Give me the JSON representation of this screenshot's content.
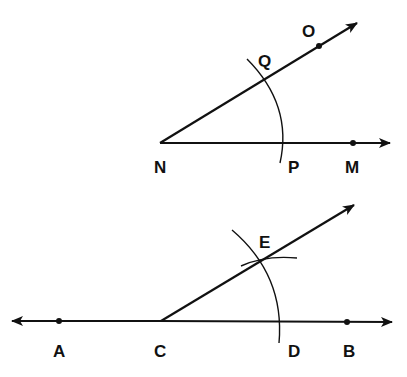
{
  "figure": {
    "top_construction": {
      "vertex": "N",
      "labels": {
        "N": "N",
        "P": "P",
        "M": "M",
        "Q": "Q",
        "O": "O"
      }
    },
    "bottom_construction": {
      "vertex": "C",
      "labels": {
        "A": "A",
        "C": "C",
        "D": "D",
        "B": "B",
        "E": "E"
      }
    },
    "colors": {
      "stroke": "#111111",
      "background": "#ffffff"
    }
  }
}
